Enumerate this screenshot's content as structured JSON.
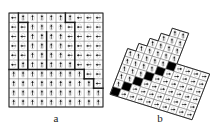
{
  "figure": {
    "background_color": "#ffffff",
    "line_color": "#6e6e6e",
    "thick_line_color": "#1a1a1a",
    "dark_cell_color": "#000000",
    "cell_fill_color": "#ffffff"
  },
  "panels": [
    {
      "id": "a",
      "caption": "a",
      "type": "rectangular-grid",
      "rows": 10,
      "cols": 10,
      "origin": {
        "x": 9,
        "y": 13
      },
      "cell_width": 9.4,
      "cell_height": 9.4,
      "arrow_names": [
        "left-arrow",
        "up-arrow",
        "right-arrow"
      ],
      "arrows": [
        [
          "left",
          "up",
          "up",
          "up",
          "up",
          "up",
          "up",
          "left",
          "left",
          "left"
        ],
        [
          "left",
          "left",
          "up",
          "up",
          "up",
          "up",
          "left",
          "left",
          "left",
          "left"
        ],
        [
          "left",
          "left",
          "up",
          "up",
          "up",
          "up",
          "left",
          "left",
          "left",
          "left"
        ],
        [
          "left",
          "left",
          "up",
          "up",
          "up",
          "up",
          "left",
          "left",
          "left",
          "left"
        ],
        [
          "left",
          "left",
          "up",
          "up",
          "up",
          "up",
          "left",
          "left",
          "left",
          "left"
        ],
        [
          "left",
          "up",
          "up",
          "up",
          "up",
          "up",
          "up",
          "left",
          "left",
          "left"
        ],
        [
          "up",
          "up",
          "up",
          "up",
          "up",
          "up",
          "up",
          "up",
          "left",
          "left"
        ],
        [
          "up",
          "up",
          "up",
          "up",
          "up",
          "up",
          "up",
          "up",
          "up",
          "left"
        ],
        [
          "up",
          "up",
          "up",
          "up",
          "up",
          "up",
          "up",
          "up",
          "up",
          "up"
        ],
        [
          "up",
          "up",
          "up",
          "up",
          "up",
          "up",
          "up",
          "up",
          "up",
          "up"
        ]
      ],
      "thick_boundaries": [
        {
          "name": "top-left-vertical",
          "x1": 1,
          "y1": 0,
          "x2": 1,
          "y2": 6
        },
        {
          "name": "upper-region-vertical",
          "x1": 2,
          "y1": 1,
          "x2": 2,
          "y2": 6
        },
        {
          "name": "upper-region-horizontal",
          "x1": 1,
          "y1": 1,
          "x2": 2,
          "y2": 1
        },
        {
          "name": "mid-vertical-left",
          "x1": 4,
          "y1": 2,
          "x2": 4,
          "y2": 6
        },
        {
          "name": "mid-vertical-right",
          "x1": 6,
          "y1": 0,
          "x2": 6,
          "y2": 1
        },
        {
          "name": "right-region-vertical",
          "x1": 7,
          "y1": 1,
          "x2": 7,
          "y2": 6
        },
        {
          "name": "right-region-horizontal",
          "x1": 6,
          "y1": 1,
          "x2": 7,
          "y2": 1
        },
        {
          "name": "staircase-row6",
          "x1": 0,
          "y1": 6,
          "x2": 7,
          "y2": 6
        },
        {
          "name": "staircase-step1-v",
          "x1": 8,
          "y1": 6,
          "x2": 8,
          "y2": 7
        },
        {
          "name": "staircase-step1-h",
          "x1": 7,
          "y1": 6,
          "x2": 8,
          "y2": 6
        },
        {
          "name": "staircase-step2-h",
          "x1": 8,
          "y1": 7,
          "x2": 9,
          "y2": 7
        },
        {
          "name": "staircase-step2-v",
          "x1": 9,
          "y1": 7,
          "x2": 9,
          "y2": 8
        },
        {
          "name": "staircase-step3-h",
          "x1": 9,
          "y1": 8,
          "x2": 10,
          "y2": 8
        }
      ]
    },
    {
      "id": "b",
      "caption": "b",
      "type": "sheared-grid",
      "rows": 10,
      "cols": 10,
      "description": "Chevron-shaped sheared grid with black cells along an anti-diagonal separating an up-arrow region from a right-arrow region",
      "arrow_names": [
        "up-arrow",
        "right-arrow"
      ],
      "dark_cells": [
        {
          "row": 4,
          "col": 5
        },
        {
          "row": 5,
          "col": 4
        },
        {
          "row": 6,
          "col": 3
        },
        {
          "row": 7,
          "col": 2
        },
        {
          "row": 8,
          "col": 1
        },
        {
          "row": 9,
          "col": 0
        }
      ],
      "regions": [
        {
          "name": "up-arrow-region",
          "arrow": "up"
        },
        {
          "name": "right-arrow-region",
          "arrow": "right"
        }
      ]
    }
  ]
}
